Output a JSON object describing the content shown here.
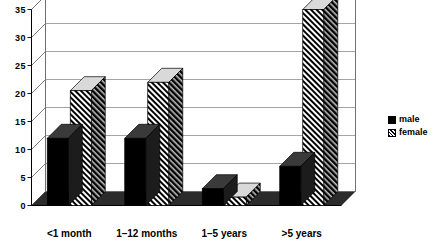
{
  "chart_data": {
    "type": "bar",
    "title": "",
    "subtitle": "",
    "xlabel": "",
    "ylabel": "",
    "categories": [
      "<1 month",
      "1–12 months",
      "1–5 years",
      ">5 years"
    ],
    "series": [
      {
        "name": "male",
        "values": [
          12,
          12,
          3,
          7
        ]
      },
      {
        "name": "female",
        "values": [
          20.5,
          22,
          1.5,
          35
        ]
      }
    ],
    "ylim": [
      0,
      35
    ],
    "ytick_values": [
      0,
      5,
      10,
      15,
      20,
      25,
      30,
      35
    ],
    "ytick_labels": [
      "0",
      "5",
      "10",
      "15",
      "20",
      "25",
      "30",
      "35"
    ],
    "grid": true,
    "grid_axis": "y",
    "legend_position": "right",
    "style": "3d-bar",
    "colors": {
      "male": "#000000",
      "female_hatch": "#000000",
      "female_background": "#ffffff",
      "grid": "#9a9a9a",
      "axis": "#6e6e6e",
      "plot_background": "#ffffff",
      "bar_side_face": "#1c1c1c",
      "floor": "#2b2b2b"
    }
  },
  "legend": {
    "items": [
      {
        "label": "male",
        "swatch": "solid-black-swatch"
      },
      {
        "label": "female",
        "swatch": "diagonal-hatch-swatch"
      }
    ]
  }
}
